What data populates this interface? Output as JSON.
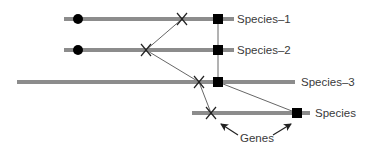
{
  "diagram": {
    "colors": {
      "chromosome": "#8c8c8c",
      "connector": "#555555",
      "marker": "#000000",
      "text": "#3a3a3a"
    },
    "species": [
      {
        "label": "Species–1"
      },
      {
        "label": "Species–2"
      },
      {
        "label": "Species–3"
      },
      {
        "label": "Species"
      }
    ],
    "annotation": {
      "label": "Genes"
    },
    "marker_types": {
      "circle": "circle-marker",
      "cross": "cross-marker",
      "square": "square-marker"
    }
  }
}
